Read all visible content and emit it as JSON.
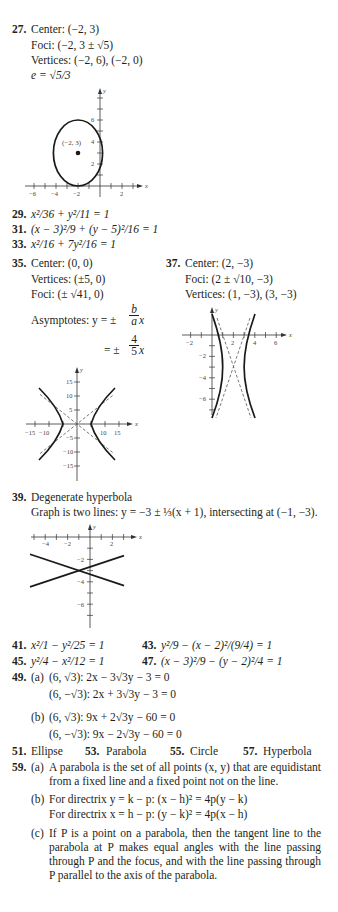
{
  "answers": {
    "a27": {
      "number": "27.",
      "center": "Center:  (−2, 3)",
      "foci": "Foci:  (−2, 3 ± √5)",
      "vertices": "Vertices:  (−2, 6), (−2, 0)",
      "eccentricity": "e = √5/3",
      "graph_label": "(−2, 3)"
    },
    "a29": {
      "number": "29.",
      "text": "x²/36 + y²/11 = 1"
    },
    "a31": {
      "number": "31.",
      "text": "(x − 3)²/9 + (y − 5)²/16 = 1"
    },
    "a33": {
      "number": "33.",
      "text": "x²/16 + 7y²/16 = 1"
    },
    "a35": {
      "number": "35.",
      "center": "Center:  (0, 0)",
      "vertices": "Vertices:  (±5, 0)",
      "foci": "Foci:  (± √41, 0)",
      "asymptotes_label": "Asymptotes:  y = ±",
      "frac1_num": "b",
      "frac1_den": "a",
      "x1": "x",
      "eq2_prefix": "= ±",
      "frac2_num": "4",
      "frac2_den": "5",
      "x2": "x"
    },
    "a37": {
      "number": "37.",
      "center": "Center:  (2, −3)",
      "foci": "Foci:  (2 ± √10, −3)",
      "vertices": "Vertices:  (1, −3), (3, −3)"
    },
    "a39": {
      "number": "39.",
      "title": "Degenerate hyperbola",
      "text": "Graph is two lines: y = −3 ± ⅓(x + 1), intersecting at (−1, −3)."
    },
    "a41": {
      "number": "41.",
      "text": "x²/1 − y²/25 = 1"
    },
    "a43": {
      "number": "43.",
      "text": "y²/9 − (x − 2)²/(9/4) = 1"
    },
    "a45": {
      "number": "45.",
      "text": "y²/4 − x²/12 = 1"
    },
    "a47": {
      "number": "47.",
      "text": "(x − 3)²/9 − (y − 2)²/4 = 1"
    },
    "a49": {
      "number": "49.",
      "a_label": "(a)",
      "a1": "(6, √3): 2x − 3√3y − 3 = 0",
      "a2": "(6, −√3): 2x + 3√3y − 3 = 0",
      "b_label": "(b)",
      "b1": "(6, √3): 9x + 2√3y − 60 = 0",
      "b2": "(6, −√3): 9x − 2√3y − 60 = 0"
    },
    "a51": {
      "number": "51.",
      "text": "Ellipse"
    },
    "a53": {
      "number": "53.",
      "text": "Parabola"
    },
    "a55": {
      "number": "55.",
      "text": "Circle"
    },
    "a57": {
      "number": "57.",
      "text": "Hyperbola"
    },
    "a59": {
      "number": "59.",
      "a_label": "(a)",
      "a_text": "A parabola is the set of all points (x, y) that are equidistant from a fixed line and a fixed point not on the line.",
      "b_label": "(b)",
      "b1": "For directrix y = k − p:  (x − h)² = 4p(y − k)",
      "b2": "For directrix x = h − p:  (y − k)² = 4p(x − h)",
      "c_label": "(c)",
      "c_text": "If P is a point on a parabola, then the tangent line to the parabola at P makes equal angles with the line passing through P and the focus, and with the line passing through P parallel to the axis of the parabola."
    }
  },
  "graphs": {
    "ellipse": {
      "x_ticks": [
        "−6",
        "−4",
        "−2",
        "2"
      ],
      "y_ticks": [
        "2",
        "4",
        "6"
      ],
      "x_label": "x",
      "y_label": "y"
    },
    "hyperbola35": {
      "x_ticks": [
        "−15",
        "−10",
        "10",
        "15"
      ],
      "y_ticks": [
        "15",
        "10",
        "5",
        "−5",
        "−10",
        "−15"
      ],
      "x_label": "x",
      "y_label": "y"
    },
    "hyperbola37": {
      "x_ticks": [
        "−2",
        "2",
        "4",
        "6"
      ],
      "y_ticks": [
        "−2",
        "−4",
        "−6"
      ],
      "x_label": "x",
      "y_label": "y"
    },
    "lines39": {
      "x_ticks": [
        "−4",
        "−2",
        "2"
      ],
      "y_ticks": [
        "−2",
        "−4",
        "−6"
      ],
      "x_label": "x",
      "y_label": "y"
    }
  }
}
